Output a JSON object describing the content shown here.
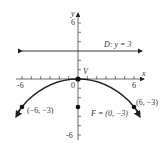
{
  "diagram": {
    "type": "parabola-graph",
    "axes": {
      "x_label": "x",
      "y_label": "y",
      "x_ticks": [
        "-6",
        "0",
        "6"
      ],
      "y_ticks": [
        "6",
        "-6"
      ],
      "range": {
        "x": [
          -6,
          6
        ],
        "y": [
          -6,
          6
        ]
      }
    },
    "directrix": {
      "label": "D: y = 3",
      "y": 3
    },
    "vertex": {
      "label": "V",
      "x": 0,
      "y": 0
    },
    "focus": {
      "label": "F = (0, −3)",
      "x": 0,
      "y": -3
    },
    "points": [
      {
        "label": "(−6, −3)",
        "x": -6,
        "y": -3
      },
      {
        "label": "(6, −3)",
        "x": 6,
        "y": -3
      }
    ],
    "curve_equation": "x^2 = -12y",
    "colors": {
      "line": "#222222",
      "text": "#333333",
      "axis": "#555555"
    }
  }
}
